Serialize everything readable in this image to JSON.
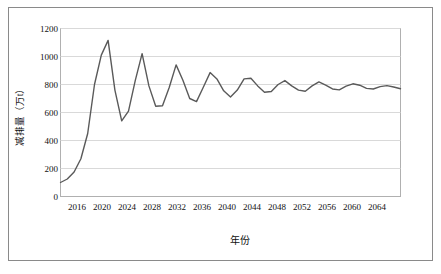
{
  "chart_data": {
    "type": "line",
    "title": "",
    "xlabel": "年份",
    "ylabel": "减排量（万t）",
    "xlim": [
      2016,
      2066
    ],
    "ylim": [
      0,
      1200
    ],
    "grid": true,
    "legend": null,
    "y_ticks": [
      "0",
      "200",
      "400",
      "600",
      "800",
      "1000",
      "1200"
    ],
    "y_tick_values": [
      0,
      200,
      400,
      600,
      800,
      1000,
      1200
    ],
    "x_ticks": [
      "2016",
      "2020",
      "2024",
      "2028",
      "2032",
      "2036",
      "2040",
      "2044",
      "2048",
      "2052",
      "2056",
      "2060",
      "2064"
    ],
    "x_tick_values": [
      2016,
      2020,
      2024,
      2028,
      2032,
      2036,
      2040,
      2044,
      2048,
      2052,
      2056,
      2060,
      2064
    ],
    "series": [
      {
        "name": "减排量",
        "color": "#5a5a5a",
        "x": [
          2016,
          2017,
          2018,
          2019,
          2020,
          2021,
          2022,
          2023,
          2024,
          2025,
          2026,
          2027,
          2028,
          2029,
          2030,
          2031,
          2032,
          2033,
          2034,
          2035,
          2036,
          2037,
          2038,
          2039,
          2040,
          2041,
          2042,
          2043,
          2044,
          2045,
          2046,
          2047,
          2048,
          2049,
          2050,
          2051,
          2052,
          2053,
          2054,
          2055,
          2056,
          2057,
          2058,
          2059,
          2060,
          2061,
          2062,
          2063,
          2064,
          2065,
          2066
        ],
        "values": [
          100,
          125,
          175,
          270,
          450,
          800,
          1010,
          1115,
          760,
          540,
          610,
          830,
          1020,
          790,
          645,
          648,
          780,
          940,
          830,
          700,
          678,
          780,
          885,
          840,
          755,
          710,
          760,
          840,
          845,
          790,
          745,
          750,
          800,
          828,
          790,
          760,
          752,
          790,
          818,
          795,
          768,
          762,
          788,
          805,
          795,
          772,
          768,
          785,
          792,
          782,
          770
        ]
      }
    ]
  },
  "axes": {
    "y_title": "减排量（万t）",
    "x_title": "年份"
  }
}
